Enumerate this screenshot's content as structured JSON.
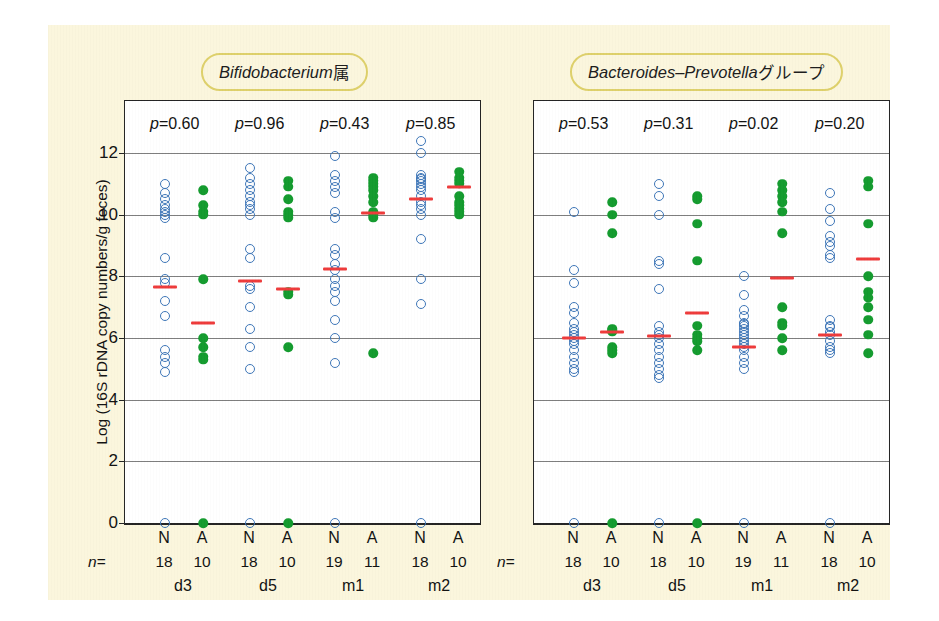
{
  "figure": {
    "background_color": "#fbf6dd",
    "axis_color": "#232323",
    "grid_color": "#7d7d7d",
    "open_marker_color": "#3d76b8",
    "filled_marker_color": "#139b2e",
    "median_marker_color": "#ee3a3a",
    "title_pill_border_color": "#ded06a",
    "ylabel": "Log (16S rDNA copy numbers/g feces)",
    "yticks": [
      "0",
      "2",
      "4",
      "6",
      "8",
      "10",
      "12"
    ],
    "n_prefix": "n="
  },
  "chart_data": [
    {
      "type": "scatter",
      "title": "Bifidobacterium属",
      "title_italic_part": "Bifidobacterium",
      "title_plain_part": "属",
      "xlabel": "",
      "ylabel": "Log (16S rDNA copy numbers/g feces)",
      "ylim": [
        0,
        12
      ],
      "yticks": [
        0,
        2,
        4,
        6,
        8,
        10,
        12
      ],
      "grid": true,
      "legend": "none",
      "timepoints": [
        "d3",
        "d5",
        "m1",
        "m2"
      ],
      "pvalues": [
        "p=0.60",
        "p=0.96",
        "p=0.43",
        "p=0.85"
      ],
      "groups": [
        {
          "timepoint": "d3",
          "series": [
            {
              "name": "N",
              "marker": "open-circle",
              "color": "#3d76b8",
              "n": 18,
              "median": 7.65,
              "values": [
                11.0,
                10.7,
                10.5,
                10.3,
                10.2,
                10.1,
                10.0,
                9.9,
                8.6,
                7.9,
                7.8,
                7.2,
                6.7,
                5.6,
                5.4,
                5.2,
                4.9,
                0.0
              ]
            },
            {
              "name": "A",
              "marker": "filled-circle",
              "color": "#139b2e",
              "n": 10,
              "median": 6.5,
              "values": [
                10.8,
                10.3,
                10.1,
                10.0,
                7.9,
                6.0,
                5.7,
                5.4,
                5.3,
                0.0
              ]
            }
          ]
        },
        {
          "timepoint": "d5",
          "series": [
            {
              "name": "N",
              "marker": "open-circle",
              "color": "#3d76b8",
              "n": 18,
              "median": 7.85,
              "values": [
                11.5,
                11.2,
                11.0,
                10.8,
                10.6,
                10.4,
                10.3,
                10.2,
                10.0,
                8.9,
                8.6,
                7.7,
                7.6,
                7.0,
                6.3,
                5.7,
                5.0,
                0.0
              ]
            },
            {
              "name": "A",
              "marker": "filled-circle",
              "color": "#139b2e",
              "n": 10,
              "median": 7.6,
              "values": [
                11.1,
                10.9,
                10.5,
                10.1,
                10.0,
                9.9,
                7.5,
                7.4,
                5.7,
                0.0
              ]
            }
          ]
        },
        {
          "timepoint": "m1",
          "series": [
            {
              "name": "N",
              "marker": "open-circle",
              "color": "#3d76b8",
              "n": 19,
              "median": 8.25,
              "values": [
                11.9,
                11.3,
                11.1,
                10.9,
                10.7,
                10.1,
                9.9,
                8.9,
                8.7,
                8.4,
                8.2,
                7.9,
                7.7,
                7.5,
                7.2,
                6.6,
                6.0,
                5.2,
                0.0
              ]
            },
            {
              "name": "A",
              "marker": "filled-circle",
              "color": "#139b2e",
              "n": 11,
              "median": 10.05,
              "values": [
                11.2,
                11.1,
                11.0,
                10.9,
                10.8,
                10.6,
                10.4,
                10.1,
                10.0,
                9.9,
                5.5
              ]
            }
          ]
        },
        {
          "timepoint": "m2",
          "series": [
            {
              "name": "N",
              "marker": "open-circle",
              "color": "#3d76b8",
              "n": 18,
              "median": 10.5,
              "values": [
                12.4,
                12.0,
                11.3,
                11.2,
                11.1,
                11.0,
                10.8,
                10.6,
                10.4,
                10.2,
                10.0,
                9.2,
                7.9,
                7.1,
                0.0,
                11.15,
                10.9,
                10.3
              ]
            },
            {
              "name": "A",
              "marker": "filled-circle",
              "color": "#139b2e",
              "n": 10,
              "median": 10.9,
              "values": [
                11.4,
                11.2,
                11.1,
                11.0,
                10.6,
                10.4,
                10.3,
                10.2,
                10.1,
                10.0
              ]
            }
          ]
        }
      ]
    },
    {
      "type": "scatter",
      "title": "Bacteroides–Prevotellaグループ",
      "title_italic_part": "Bacteroides–Prevotella",
      "title_plain_part": "グループ",
      "xlabel": "",
      "ylabel": "Log (16S rDNA copy numbers/g feces)",
      "ylim": [
        0,
        12
      ],
      "yticks": [
        0,
        2,
        4,
        6,
        8,
        10,
        12
      ],
      "grid": true,
      "legend": "none",
      "timepoints": [
        "d3",
        "d5",
        "m1",
        "m2"
      ],
      "pvalues": [
        "p=0.53",
        "p=0.31",
        "p=0.02",
        "p=0.20"
      ],
      "groups": [
        {
          "timepoint": "d3",
          "series": [
            {
              "name": "N",
              "marker": "open-circle",
              "color": "#3d76b8",
              "n": 18,
              "median": 6.0,
              "values": [
                10.1,
                8.2,
                7.8,
                7.0,
                6.8,
                6.5,
                6.3,
                6.2,
                6.1,
                6.0,
                5.9,
                5.8,
                5.6,
                5.4,
                5.2,
                5.0,
                4.9,
                0.0
              ]
            },
            {
              "name": "A",
              "marker": "filled-circle",
              "color": "#139b2e",
              "n": 10,
              "median": 6.2,
              "values": [
                10.4,
                10.0,
                9.4,
                6.3,
                6.2,
                5.7,
                5.6,
                5.5,
                0.0,
                6.25
              ]
            }
          ]
        },
        {
          "timepoint": "d5",
          "series": [
            {
              "name": "N",
              "marker": "open-circle",
              "color": "#3d76b8",
              "n": 18,
              "median": 6.05,
              "values": [
                11.0,
                10.6,
                10.0,
                8.5,
                8.4,
                7.6,
                6.4,
                6.2,
                6.1,
                6.0,
                5.8,
                5.6,
                5.4,
                5.2,
                5.0,
                4.8,
                4.7,
                0.0
              ]
            },
            {
              "name": "A",
              "marker": "filled-circle",
              "color": "#139b2e",
              "n": 10,
              "median": 6.8,
              "values": [
                10.6,
                10.5,
                9.7,
                8.5,
                6.4,
                6.1,
                6.0,
                5.9,
                5.6,
                0.0
              ]
            }
          ]
        },
        {
          "timepoint": "m1",
          "series": [
            {
              "name": "N",
              "marker": "open-circle",
              "color": "#3d76b8",
              "n": 19,
              "median": 5.7,
              "values": [
                8.0,
                7.4,
                6.9,
                6.7,
                6.5,
                6.4,
                6.3,
                6.2,
                6.1,
                6.0,
                5.9,
                5.8,
                5.7,
                5.6,
                5.4,
                5.2,
                5.0,
                0.0,
                6.45
              ]
            },
            {
              "name": "A",
              "marker": "filled-circle",
              "color": "#139b2e",
              "n": 11,
              "median": 7.95,
              "values": [
                11.0,
                10.8,
                10.6,
                10.4,
                10.1,
                9.4,
                7.0,
                6.5,
                6.4,
                6.0,
                5.6
              ]
            }
          ]
        },
        {
          "timepoint": "m2",
          "series": [
            {
              "name": "N",
              "marker": "open-circle",
              "color": "#3d76b8",
              "n": 18,
              "median": 6.1,
              "values": [
                10.7,
                10.2,
                9.8,
                9.3,
                9.1,
                8.6,
                6.6,
                6.4,
                6.2,
                6.1,
                5.9,
                5.7,
                5.6,
                5.5,
                0.0,
                6.35,
                8.7,
                9.0
              ]
            },
            {
              "name": "A",
              "marker": "filled-circle",
              "color": "#139b2e",
              "n": 10,
              "median": 8.55,
              "values": [
                11.1,
                10.9,
                9.7,
                8.0,
                7.5,
                7.0,
                6.6,
                6.1,
                5.5,
                7.3
              ]
            }
          ]
        }
      ]
    }
  ],
  "axis_labels": {
    "group_letters": [
      "N",
      "A"
    ],
    "panels": [
      {
        "id": "left",
        "n_values": [
          [
            "18",
            "10"
          ],
          [
            "18",
            "10"
          ],
          [
            "19",
            "11"
          ],
          [
            "18",
            "10"
          ]
        ],
        "timepoints": [
          "d3",
          "d5",
          "m1",
          "m2"
        ]
      },
      {
        "id": "right",
        "n_values": [
          [
            "18",
            "10"
          ],
          [
            "18",
            "10"
          ],
          [
            "19",
            "11"
          ],
          [
            "18",
            "10"
          ]
        ],
        "timepoints": [
          "d3",
          "d5",
          "m1",
          "m2"
        ]
      }
    ]
  }
}
